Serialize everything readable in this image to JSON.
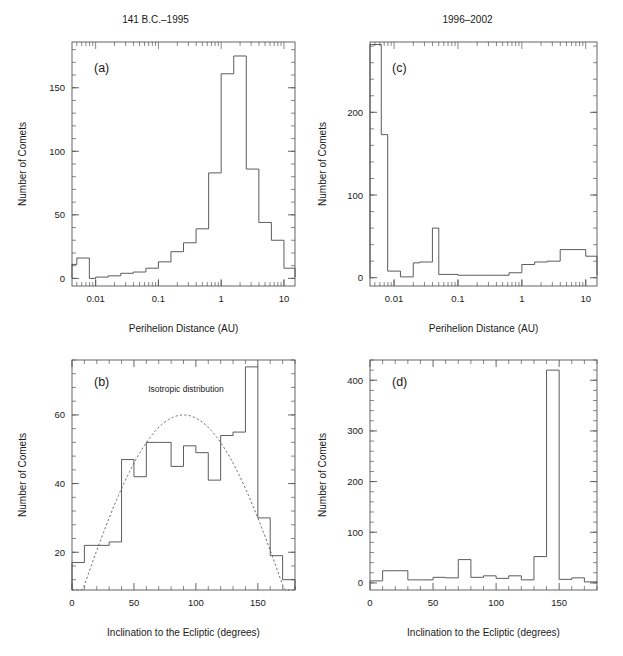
{
  "running_head": "",
  "figure": {
    "width": 623,
    "height": 656,
    "background": "#ffffff",
    "line_color": "#4a4a4a",
    "text_color": "#1a1a1a"
  },
  "column_titles": {
    "left": "141 B.C.–1995",
    "right": "1996–2002"
  },
  "axis_titles": {
    "perihelion": "Perihelion Distance (AU)",
    "inclination": "Inclination to the Ecliptic (degrees)",
    "comets": "Number of Comets"
  },
  "chart_data": [
    {
      "id": "panel-a",
      "type": "bar",
      "panel_letter": "(a)",
      "title": "141 B.C.–1995",
      "xlabel": "Perihelion Distance (AU)",
      "ylabel": "Number of Comets",
      "xscale": "log",
      "xlim": [
        0.0042,
        15.0
      ],
      "ylim": [
        -6,
        186
      ],
      "yticks": [
        0,
        50,
        100,
        150
      ],
      "xticks_major": [
        0.01,
        0.1,
        1,
        10
      ],
      "xticks_major_labels": [
        "0.01",
        "0.1",
        "1",
        "10"
      ],
      "grid": false,
      "legend": "none",
      "bin_edges_log10": [
        -2.4,
        -2.3,
        -2.2,
        -2.1,
        -2.0,
        -1.8,
        -1.6,
        -1.4,
        -1.2,
        -1.0,
        -0.8,
        -0.6,
        -0.4,
        -0.2,
        0.0,
        0.2,
        0.4,
        0.6,
        0.8,
        1.0,
        1.2
      ],
      "values": [
        11,
        16,
        16,
        0,
        1,
        2,
        4,
        5,
        8,
        13,
        21,
        28,
        39,
        83,
        161,
        175,
        86,
        44,
        30,
        8,
        1
      ]
    },
    {
      "id": "panel-b",
      "type": "bar",
      "panel_letter": "(b)",
      "title": "141 B.C.–1995",
      "xlabel": "Inclination to the Ecliptic (degrees)",
      "ylabel": "Number of Comets",
      "xscale": "linear",
      "xlim": [
        0,
        180
      ],
      "ylim": [
        9,
        76
      ],
      "yticks": [
        20,
        40,
        60
      ],
      "xticks_major": [
        0,
        50,
        100,
        150
      ],
      "xticks_major_labels": [
        "0",
        "50",
        "100",
        "150"
      ],
      "grid": false,
      "bin_width": 10,
      "categories": [
        "0–10",
        "10–20",
        "20–30",
        "30–40",
        "40–50",
        "50–60",
        "60–70",
        "70–80",
        "80–90",
        "90–100",
        "100–110",
        "110–120",
        "120–130",
        "130–140",
        "140–150",
        "150–160",
        "160–170",
        "170–180"
      ],
      "values": [
        17,
        22,
        22,
        23,
        47,
        42,
        52,
        52,
        45,
        51,
        49,
        41,
        54,
        55,
        74,
        30,
        19,
        12
      ],
      "overlay": {
        "name": "Isotropic distribution",
        "type": "line",
        "style": "dashed",
        "label": "Isotropic distribution",
        "label_x": 92,
        "label_y": 66,
        "formula": "amplitude * sin(i)",
        "amplitude": 60
      }
    },
    {
      "id": "panel-c",
      "type": "bar",
      "panel_letter": "(c)",
      "title": "1996–2002",
      "xlabel": "Perihelion Distance (AU)",
      "ylabel": "Number of Comets",
      "xscale": "log",
      "xlim": [
        0.0042,
        15.0
      ],
      "ylim": [
        -10,
        285
      ],
      "yticks": [
        0,
        100,
        200
      ],
      "xticks_major": [
        0.01,
        0.1,
        1,
        10
      ],
      "xticks_major_labels": [
        "0.01",
        "0.1",
        "1",
        "10"
      ],
      "grid": false,
      "bin_edges_log10": [
        -2.4,
        -2.2,
        -2.1,
        -2.0,
        -1.9,
        -1.8,
        -1.7,
        -1.6,
        -1.4,
        -1.3,
        -1.2,
        -1.0,
        -0.8,
        -0.6,
        -0.4,
        -0.2,
        0.0,
        0.2,
        0.4,
        0.6,
        0.8,
        1.0,
        1.2
      ],
      "values": [
        282,
        173,
        8,
        8,
        1,
        1,
        18,
        19,
        60,
        4,
        4,
        3,
        3,
        3,
        3,
        6,
        16,
        19,
        20,
        34,
        34,
        26,
        3
      ]
    },
    {
      "id": "panel-d",
      "type": "bar",
      "panel_letter": "(d)",
      "title": "1996–2002",
      "xlabel": "Inclination to the Ecliptic (degrees)",
      "ylabel": "Number of Comets",
      "xscale": "linear",
      "xlim": [
        0,
        180
      ],
      "ylim": [
        -14,
        440
      ],
      "yticks": [
        0,
        100,
        200,
        300,
        400
      ],
      "xticks_major": [
        0,
        50,
        100,
        150
      ],
      "xticks_major_labels": [
        "0",
        "50",
        "100",
        "150"
      ],
      "grid": false,
      "bin_width": 10,
      "categories": [
        "0–10",
        "10–20",
        "20–30",
        "30–40",
        "40–50",
        "50–60",
        "60–70",
        "70–80",
        "80–90",
        "90–100",
        "100–110",
        "110–120",
        "120–130",
        "130–140",
        "140–150",
        "150–160",
        "160–170",
        "170–180"
      ],
      "values": [
        4,
        24,
        24,
        6,
        6,
        11,
        10,
        46,
        11,
        14,
        9,
        14,
        6,
        52,
        420,
        7,
        10,
        2
      ]
    }
  ]
}
